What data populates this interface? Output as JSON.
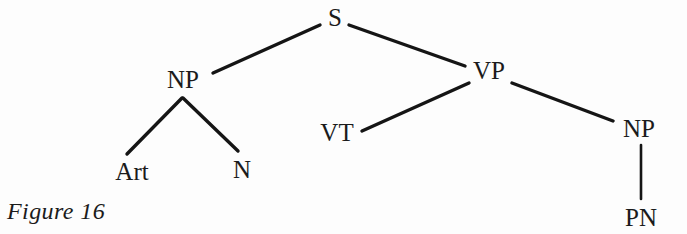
{
  "figure": {
    "caption": "Figure 16",
    "background_color": "#fdfdfd",
    "ink_color": "#151515",
    "type": "syntax-tree-diagram"
  },
  "tree": {
    "nodes": [
      {
        "id": "S",
        "label": "S",
        "x": 335,
        "y": 26
      },
      {
        "id": "NP1",
        "label": "NP",
        "x": 183,
        "y": 88
      },
      {
        "id": "VP",
        "label": "VP",
        "x": 489,
        "y": 79
      },
      {
        "id": "Art",
        "label": "Art",
        "x": 132,
        "y": 180
      },
      {
        "id": "N",
        "label": "N",
        "x": 242,
        "y": 178
      },
      {
        "id": "VT",
        "label": "VT",
        "x": 337,
        "y": 141
      },
      {
        "id": "NP2",
        "label": "NP",
        "x": 639,
        "y": 137
      },
      {
        "id": "PN",
        "label": "PN",
        "x": 641,
        "y": 226
      }
    ],
    "edges": [
      {
        "from": "NP1",
        "to": "S",
        "x1": 213,
        "y1": 73,
        "x2": 320,
        "y2": 25
      },
      {
        "from": "S",
        "to": "VP",
        "x1": 349,
        "y1": 25,
        "x2": 465,
        "y2": 66
      },
      {
        "from": "NP1",
        "to": "Art",
        "x1": 182,
        "y1": 98,
        "x2": 127,
        "y2": 154
      },
      {
        "from": "NP1",
        "to": "N",
        "x1": 183,
        "y1": 98,
        "x2": 238,
        "y2": 151
      },
      {
        "from": "VP",
        "to": "VT",
        "x1": 362,
        "y1": 131,
        "x2": 469,
        "y2": 83
      },
      {
        "from": "VP",
        "to": "NP2",
        "x1": 512,
        "y1": 83,
        "x2": 613,
        "y2": 121
      },
      {
        "from": "NP2",
        "to": "PN",
        "x1": 641,
        "y1": 145,
        "x2": 641,
        "y2": 199
      }
    ]
  }
}
